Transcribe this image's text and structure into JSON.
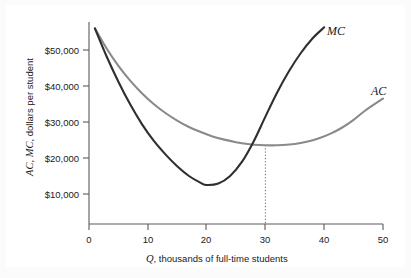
{
  "chart_data": {
    "type": "line",
    "title": "",
    "xlabel": "Q, thousands of full-time students",
    "xlabel_symbol": "Q",
    "xlabel_rest": ", thousands of full-time students",
    "ylabel": "AC, MC, dollars per student",
    "ylabel_symbol_1": "AC",
    "ylabel_symbol_2": "MC",
    "ylabel_rest": ", dollars per student",
    "xlim": [
      0,
      50
    ],
    "ylim": [
      0,
      56000
    ],
    "grid": false,
    "legend_position": "inline-curve-labels",
    "xticks": [
      0,
      10,
      20,
      30,
      40,
      50
    ],
    "xtick_labels": [
      "0",
      "10",
      "20",
      "30",
      "40",
      "50"
    ],
    "yticks": [
      10000,
      20000,
      30000,
      40000,
      50000
    ],
    "ytick_labels": [
      "$10,000",
      "$20,000",
      "$30,000",
      "$40,000",
      "$50,000"
    ],
    "series": [
      {
        "name": "MC",
        "label": "MC",
        "color": "#2f2f33",
        "x": [
          1,
          3,
          5,
          7,
          9,
          11,
          13,
          15,
          17,
          19,
          20,
          22,
          24,
          26,
          28,
          30,
          32,
          34,
          36,
          38,
          40
        ],
        "values": [
          56000,
          48200,
          41200,
          34900,
          29400,
          24800,
          21000,
          17700,
          15000,
          13100,
          12500,
          12900,
          15000,
          18900,
          24600,
          31500,
          38200,
          44100,
          49100,
          53200,
          56300
        ]
      },
      {
        "name": "AC",
        "label": "AC",
        "color": "#8a8a8e",
        "x": [
          1,
          3,
          5,
          7,
          9,
          11,
          13,
          15,
          17,
          19,
          21,
          23,
          25,
          27,
          29,
          31,
          33,
          35,
          37,
          39,
          41,
          43,
          45,
          47,
          50
        ],
        "values": [
          56000,
          50400,
          45600,
          41500,
          38000,
          35000,
          32500,
          30400,
          28600,
          27200,
          26000,
          25100,
          24400,
          23900,
          23600,
          23500,
          23600,
          23900,
          24500,
          25400,
          26700,
          28400,
          30600,
          33200,
          36500
        ]
      }
    ],
    "annotations": [
      {
        "name": "efficient-scale-dropline",
        "type": "vertical-dotted-line",
        "x": 30,
        "y_top": 23600,
        "y_bottom": 0,
        "description": "dotted line from AC/MC intersection at minimum AC down to x-axis"
      }
    ],
    "intersection": {
      "x": 30,
      "y": 23600,
      "description": "MC crosses AC at the minimum of AC"
    }
  }
}
